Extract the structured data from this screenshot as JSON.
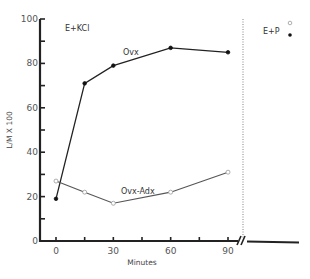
{
  "chart_data": {
    "type": "line",
    "title": "",
    "xlabel": "Minutes",
    "ylabel": "L/M X 100",
    "xlim": [
      0,
      90
    ],
    "ylim": [
      0,
      100
    ],
    "x_ticks": [
      0,
      15,
      30,
      45,
      60,
      75,
      90
    ],
    "x_tick_labels": [
      "0",
      "30",
      "60",
      "90"
    ],
    "y_ticks": [
      0,
      10,
      20,
      30,
      40,
      50,
      60,
      70,
      80,
      90,
      100
    ],
    "y_tick_labels": [
      "0",
      "20",
      "40",
      "60",
      "80",
      "100"
    ],
    "grid": false,
    "x": [
      0,
      15,
      30,
      60,
      90
    ],
    "series": [
      {
        "name": "Ovx",
        "marker": "filled-circle",
        "values": [
          19,
          71,
          79,
          87,
          85
        ]
      },
      {
        "name": "Ovx-Adx",
        "marker": "open-circle",
        "values": [
          27,
          22,
          17,
          22,
          31
        ]
      }
    ],
    "annotations": [
      {
        "text": "E+KCl",
        "position": "top-left"
      },
      {
        "text": "Ovx",
        "near_series": "Ovx"
      },
      {
        "text": "Ovx-Adx",
        "near_series": "Ovx-Adx"
      },
      {
        "text": "E+P",
        "position": "right panel, after axis break"
      }
    ],
    "axis_break": "after 90 minutes (dotted vertical line and // marks)",
    "legend": {
      "position": "right panel top",
      "entries": [
        {
          "marker": "open-circle"
        },
        {
          "marker": "filled-circle"
        }
      ]
    }
  },
  "labels": {
    "condition_left": "E+KCl",
    "condition_right": "E+P",
    "series_ovx": "Ovx",
    "series_ovx_adx": "Ovx-Adx",
    "xlabel": "Minutes",
    "ylabel": "L/M X 100"
  }
}
